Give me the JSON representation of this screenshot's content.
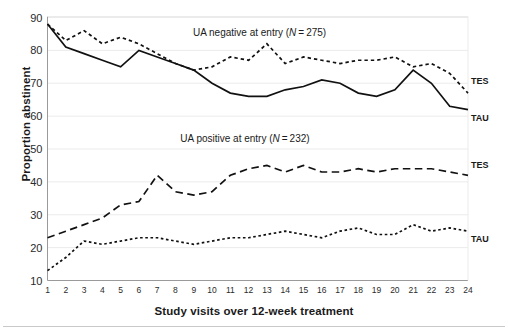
{
  "chart_data": {
    "type": "line",
    "title": "",
    "xlabel": "Study visits over 12-week treatment",
    "ylabel": "Proportion abstinent",
    "xlim": [
      1,
      24
    ],
    "ylim": [
      10,
      90
    ],
    "ytick_labels": [
      "90",
      "80",
      "70",
      "60",
      "50",
      "40",
      "30",
      "20",
      "10"
    ],
    "ytick_values": [
      90,
      80,
      70,
      60,
      50,
      40,
      30,
      20,
      10
    ],
    "xtick_labels": [
      "1",
      "2",
      "3",
      "4",
      "5",
      "6",
      "7",
      "8",
      "9",
      "10",
      "11",
      "12",
      "13",
      "14",
      "15",
      "16",
      "17",
      "18",
      "19",
      "20",
      "21",
      "22",
      "23",
      "24"
    ],
    "x": [
      1,
      2,
      3,
      4,
      5,
      6,
      7,
      8,
      9,
      10,
      11,
      12,
      13,
      14,
      15,
      16,
      17,
      18,
      19,
      20,
      21,
      22,
      23,
      24
    ],
    "grid": true,
    "legend_position": "right-inline",
    "groups": [
      {
        "annotation": "UA negative at entry (N = 275)",
        "annotation_plain": "UA negative at entry (N = 275)",
        "n": 275,
        "series": [
          {
            "name": "TES",
            "label": "TES",
            "style": "dashed-short",
            "values": [
              88,
              83,
              86,
              82,
              84,
              82,
              79,
              76,
              74,
              75,
              78,
              77,
              82,
              76,
              78,
              77,
              76,
              77,
              77,
              78,
              75,
              76,
              73,
              67
            ]
          },
          {
            "name": "TAU",
            "label": "TAU",
            "style": "solid",
            "values": [
              88,
              81,
              79,
              77,
              75,
              80,
              78,
              76,
              74,
              70,
              67,
              66,
              66,
              68,
              69,
              71,
              70,
              67,
              66,
              68,
              74,
              70,
              63,
              62
            ]
          }
        ]
      },
      {
        "annotation": "UA positive at entry (N = 232)",
        "annotation_plain": "UA positive at entry (N = 232)",
        "n": 232,
        "series": [
          {
            "name": "TES",
            "label": "TES",
            "style": "dashed-long",
            "values": [
              23,
              25,
              27,
              29,
              33,
              34,
              42,
              37,
              36,
              37,
              42,
              44,
              45,
              43,
              45,
              43,
              43,
              44,
              43,
              44,
              44,
              44,
              43,
              42
            ]
          },
          {
            "name": "TAU",
            "label": "TAU",
            "style": "dashed-fine",
            "values": [
              13,
              17,
              22,
              21,
              22,
              23,
              23,
              22,
              21,
              22,
              23,
              23,
              24,
              25,
              24,
              23,
              25,
              26,
              24,
              24,
              27,
              25,
              26,
              25
            ]
          }
        ]
      }
    ],
    "annotations": [
      {
        "text": "UA negative at entry (N = 275)",
        "x": 12.6,
        "y": 84.5
      },
      {
        "text": "UA positive at entry (N = 232)",
        "x": 11.8,
        "y": 52.0
      }
    ]
  }
}
